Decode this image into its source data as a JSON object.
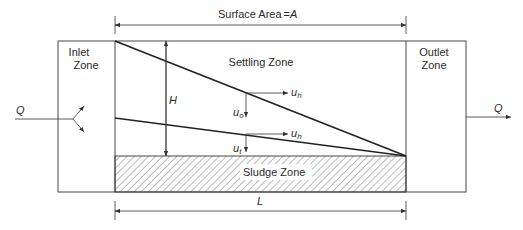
{
  "diagram": {
    "dimensions": {
      "surface_area_label": "Surface Area",
      "surface_area_equals": "=",
      "surface_area_symbol": "A",
      "length_symbol": "L",
      "height_symbol": "H"
    },
    "zones": {
      "inlet_line1": "Inlet",
      "inlet_line2": "Zone",
      "settling": "Settling Zone",
      "outlet_line1": "Outlet",
      "outlet_line2": "Zone",
      "sludge": "Sludge Zone"
    },
    "flows": {
      "inflow": "Q",
      "outflow": "Q"
    },
    "velocities": {
      "upper_horizontal_base": "u",
      "upper_horizontal_sub": "h",
      "upper_vertical_base": "u",
      "upper_vertical_sub": "o",
      "lower_horizontal_base": "u",
      "lower_horizontal_sub": "h",
      "lower_vertical_base": "u",
      "lower_vertical_sub": "t"
    },
    "colors": {
      "line": "#333333",
      "text": "#2a2a2a",
      "hatch": "#555555"
    }
  }
}
